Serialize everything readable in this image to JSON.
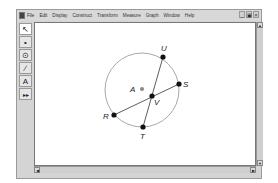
{
  "menubar": {
    "items": [
      "File",
      "Edit",
      "Display",
      "Construct",
      "Transform",
      "Measure",
      "Graph",
      "Window",
      "Help"
    ],
    "window_controls": {
      "minimize": "_",
      "maximize": "▣",
      "close": "×"
    }
  },
  "toolbar": {
    "tools": [
      {
        "name": "selection-arrow-tool",
        "glyph": "↖"
      },
      {
        "name": "point-tool",
        "glyph": "•"
      },
      {
        "name": "compass-tool",
        "glyph": "⊙"
      },
      {
        "name": "straightedge-tool",
        "glyph": "∕"
      },
      {
        "name": "text-tool",
        "glyph": "A"
      },
      {
        "name": "custom-tool",
        "glyph": "▸▸"
      }
    ]
  },
  "canvas": {
    "circle": {
      "center_label": "A",
      "stroke": "#a0a0a0"
    },
    "points": {
      "U": "U",
      "S": "S",
      "A": "A",
      "V": "V",
      "R": "R",
      "T": "T"
    },
    "segments": [
      "RS",
      "UT"
    ]
  },
  "scrollbars": {
    "up": "▲",
    "down": "▼",
    "left": "◀",
    "right": "▶"
  }
}
